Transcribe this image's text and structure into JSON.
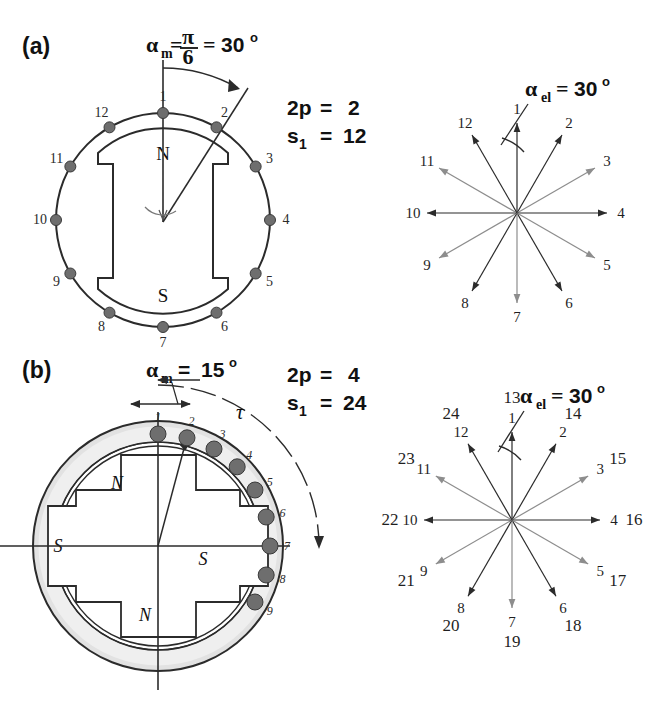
{
  "figure": {
    "ink_color": "#2b2b2b",
    "slot_fill_color": "#6e6e6e",
    "stator_fill_color": "#e2e2e2"
  },
  "panels": [
    {
      "id": "a",
      "tag": "(a)",
      "alpha_label": {
        "symbol": "α",
        "subscript": "m",
        "equals": "=",
        "fraction_num": "π",
        "fraction_den": "6",
        "equals2": "=",
        "value": "30",
        "degree": "o",
        "text": "αm = π/6 = 30°"
      },
      "specs": [
        {
          "symbol": "2p",
          "subscript": "",
          "equals": "=",
          "value": "2"
        },
        {
          "symbol": "s",
          "subscript": "1",
          "equals": "=",
          "value": "12"
        }
      ],
      "machine": {
        "poles_2p": 2,
        "slots_s1": 12,
        "slot_pitch_mech_deg": 30,
        "pole_marks": [
          {
            "text": "N",
            "x": 163,
            "y": 152
          },
          {
            "text": "S",
            "x": 163,
            "y": 295
          }
        ],
        "slot_numbers": [
          "1",
          "2",
          "3",
          "4",
          "5",
          "6",
          "7",
          "8",
          "9",
          "10",
          "11",
          "12"
        ]
      },
      "star": {
        "alpha_label": {
          "symbol": "α",
          "subscript": "el",
          "equals": "=",
          "value": "30",
          "degree": "o",
          "text": "αel = 30°"
        },
        "slot_angle_el_deg": 30,
        "vectors": [
          {
            "labels": [
              "1"
            ],
            "angle_deg": 0
          },
          {
            "labels": [
              "2"
            ],
            "angle_deg": 30
          },
          {
            "labels": [
              "3"
            ],
            "angle_deg": 60
          },
          {
            "labels": [
              "4"
            ],
            "angle_deg": 90
          },
          {
            "labels": [
              "5"
            ],
            "angle_deg": 120
          },
          {
            "labels": [
              "6"
            ],
            "angle_deg": 150
          },
          {
            "labels": [
              "7"
            ],
            "angle_deg": 180
          },
          {
            "labels": [
              "8"
            ],
            "angle_deg": 210
          },
          {
            "labels": [
              "9"
            ],
            "angle_deg": 240
          },
          {
            "labels": [
              "10"
            ],
            "angle_deg": 270
          },
          {
            "labels": [
              "11"
            ],
            "angle_deg": 300
          },
          {
            "labels": [
              "12"
            ],
            "angle_deg": 330
          }
        ]
      }
    },
    {
      "id": "b",
      "tag": "(b)",
      "alpha_label": {
        "symbol": "α",
        "subscript": "m",
        "equals": "=",
        "value": "15",
        "degree": "o",
        "text": "αm = 15°"
      },
      "tau_label": "τ",
      "specs": [
        {
          "symbol": "2p",
          "subscript": "",
          "equals": "=",
          "value": "4"
        },
        {
          "symbol": "s",
          "subscript": "1",
          "equals": "=",
          "value": "24"
        }
      ],
      "machine": {
        "poles_2p": 4,
        "slots_s1": 24,
        "slot_pitch_mech_deg": 15,
        "pole_marks": [
          {
            "text": "N",
            "x": 117,
            "y": 482
          },
          {
            "text": "S",
            "x": 55,
            "y": 545
          },
          {
            "text": "S",
            "x": 200,
            "y": 558
          },
          {
            "text": "N",
            "x": 142,
            "y": 614
          }
        ],
        "slot_numbers": [
          "1",
          "2",
          "3",
          "4",
          "5",
          "6",
          "7",
          "8",
          "9"
        ]
      },
      "star": {
        "alpha_label": {
          "symbol": "α",
          "subscript": "el",
          "equals": "=",
          "value": "30",
          "degree": "o",
          "text": "αel = 30°"
        },
        "slot_angle_el_deg": 30,
        "vectors": [
          {
            "labels": [
              "1",
              "13"
            ],
            "angle_deg": 0
          },
          {
            "labels": [
              "2",
              "14"
            ],
            "angle_deg": 30
          },
          {
            "labels": [
              "3",
              "15"
            ],
            "angle_deg": 60
          },
          {
            "labels": [
              "4",
              "16"
            ],
            "angle_deg": 90
          },
          {
            "labels": [
              "5",
              "17"
            ],
            "angle_deg": 120
          },
          {
            "labels": [
              "6",
              "18"
            ],
            "angle_deg": 150
          },
          {
            "labels": [
              "7",
              "19"
            ],
            "angle_deg": 180
          },
          {
            "labels": [
              "8",
              "20"
            ],
            "angle_deg": 210
          },
          {
            "labels": [
              "9",
              "21"
            ],
            "angle_deg": 240
          },
          {
            "labels": [
              "10",
              "22"
            ],
            "angle_deg": 270
          },
          {
            "labels": [
              "11",
              "23"
            ],
            "angle_deg": 300
          },
          {
            "labels": [
              "12",
              "24"
            ],
            "angle_deg": 330
          }
        ]
      }
    }
  ]
}
